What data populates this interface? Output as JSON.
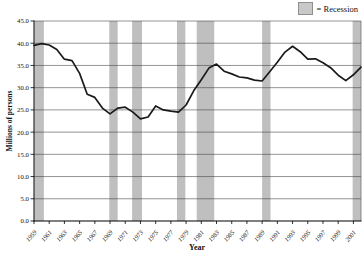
{
  "chart_data": {
    "type": "line",
    "xlabel": "Year",
    "ylabel": "Millions of persons",
    "ylim": [
      0,
      45
    ],
    "ytick_step": 5,
    "x_domain": [
      1959,
      2002
    ],
    "xticks": [
      1959,
      1961,
      1963,
      1965,
      1967,
      1969,
      1971,
      1973,
      1975,
      1977,
      1979,
      1981,
      1983,
      1985,
      1987,
      1989,
      1991,
      1993,
      1995,
      1997,
      1999,
      2001
    ],
    "years": [
      1959,
      1960,
      1961,
      1962,
      1963,
      1964,
      1965,
      1966,
      1967,
      1968,
      1969,
      1970,
      1971,
      1972,
      1973,
      1974,
      1975,
      1976,
      1977,
      1978,
      1979,
      1980,
      1981,
      1982,
      1983,
      1984,
      1985,
      1986,
      1987,
      1988,
      1989,
      1990,
      1991,
      1992,
      1993,
      1994,
      1995,
      1996,
      1997,
      1998,
      1999,
      2000,
      2001,
      2002
    ],
    "values": [
      39.5,
      39.9,
      39.6,
      38.6,
      36.4,
      36.1,
      33.2,
      28.5,
      27.8,
      25.4,
      24.1,
      25.4,
      25.6,
      24.5,
      23.0,
      23.4,
      25.9,
      25.0,
      24.7,
      24.5,
      26.1,
      29.3,
      31.8,
      34.4,
      35.3,
      33.7,
      33.1,
      32.4,
      32.2,
      31.7,
      31.5,
      33.6,
      35.7,
      38.0,
      39.3,
      38.1,
      36.4,
      36.5,
      35.6,
      34.5,
      32.8,
      31.6,
      32.9,
      34.6
    ],
    "legend_label": "= Recession",
    "recession_bands": [
      {
        "start": 1959.05,
        "end": 1960.3
      },
      {
        "start": 1968.9,
        "end": 1970.0
      },
      {
        "start": 1971.9,
        "end": 1973.2
      },
      {
        "start": 1977.8,
        "end": 1978.9
      },
      {
        "start": 1980.4,
        "end": 1982.7
      },
      {
        "start": 1989.0,
        "end": 1990.1
      },
      {
        "start": 2000.9,
        "end": 2002.0
      }
    ],
    "grid": true,
    "legend_position": "top-right",
    "colors": {
      "line": "#1a1a1a",
      "band": "#bfbfbf",
      "grid": "#3b3b3b",
      "axis": "#000000",
      "swatch": "#c8c8c8",
      "swatch_border": "#8f8f8f"
    }
  }
}
